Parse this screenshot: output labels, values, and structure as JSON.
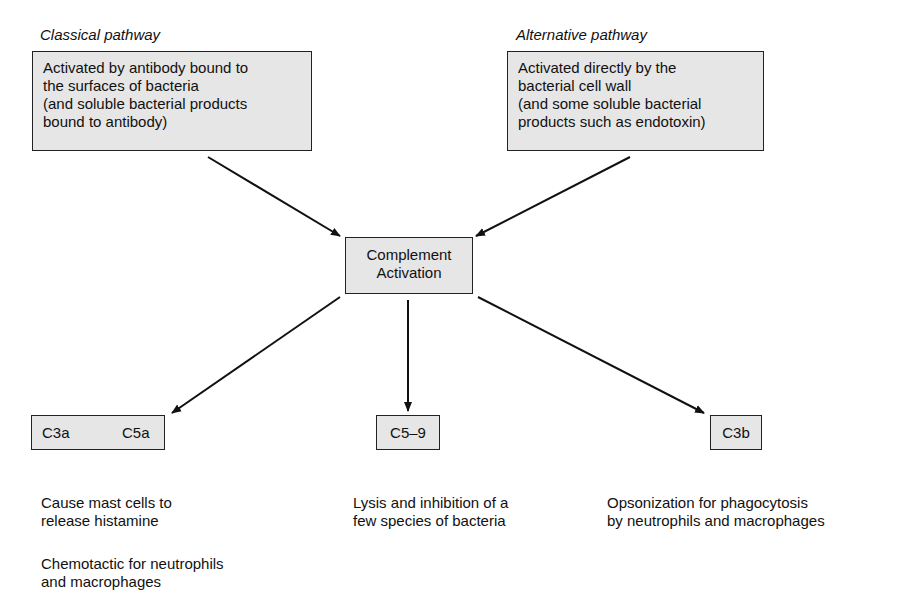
{
  "classical": {
    "title": "Classical pathway",
    "lines": [
      "Activated by antibody bound to",
      "the surfaces of bacteria",
      "(and soluble bacterial products",
      "bound to antibody)"
    ]
  },
  "alternative": {
    "title": "Alternative pathway",
    "lines": [
      "Activated directly by the",
      "bacterial cell wall",
      "(and some soluble bacterial",
      "products such as endotoxin)"
    ]
  },
  "center": {
    "lines": [
      "Complement",
      "Activation"
    ]
  },
  "outputs": {
    "left": {
      "labels": [
        "C3a",
        "C5a"
      ],
      "effects": [
        [
          "Cause mast cells to",
          "release histamine"
        ],
        [
          "Chemotactic for neutrophils",
          "and macrophages"
        ]
      ]
    },
    "middle": {
      "label": "C5–9",
      "effects": [
        [
          "Lysis and inhibition of a",
          "few species of bacteria"
        ]
      ]
    },
    "right": {
      "label": "C3b",
      "effects": [
        [
          "Opsonization for phagocytosis",
          "by neutrophils and macrophages"
        ]
      ]
    }
  },
  "colors": {
    "box_fill": "#e6e6e6",
    "stroke": "#222222"
  }
}
